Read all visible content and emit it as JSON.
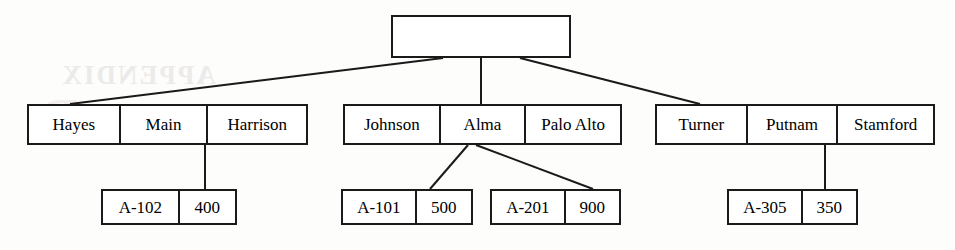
{
  "figure": {
    "watermark_text": "APPENDIX",
    "watermark_letter": "D",
    "line_color": "#1a1a1a",
    "background_color": "#fdfdfc",
    "text_color": "#000000"
  },
  "nodes": {
    "root": {
      "name": "root-index-node",
      "cells": [
        ""
      ]
    },
    "branches": [
      {
        "name": "branch-record-hayes",
        "cells": [
          "Hayes",
          "Main",
          "Harrison"
        ]
      },
      {
        "name": "branch-record-johnson",
        "cells": [
          "Johnson",
          "Alma",
          "Palo Alto"
        ]
      },
      {
        "name": "branch-record-turner",
        "cells": [
          "Turner",
          "Putnam",
          "Stamford"
        ]
      }
    ],
    "accounts": [
      {
        "name": "account-record-a102",
        "cells": [
          "A-102",
          "400"
        ]
      },
      {
        "name": "account-record-a101",
        "cells": [
          "A-101",
          "500"
        ]
      },
      {
        "name": "account-record-a201",
        "cells": [
          "A-201",
          "900"
        ]
      },
      {
        "name": "account-record-a305",
        "cells": [
          "A-305",
          "350"
        ]
      }
    ]
  },
  "edges": [
    {
      "name": "edge-root-to-hayes",
      "x1": 443,
      "y1": 58,
      "x2": 70,
      "y2": 104
    },
    {
      "name": "edge-root-to-johnson",
      "x1": 481,
      "y1": 58,
      "x2": 481,
      "y2": 104
    },
    {
      "name": "edge-root-to-turner",
      "x1": 520,
      "y1": 58,
      "x2": 700,
      "y2": 104
    },
    {
      "name": "edge-main-to-a102",
      "x1": 205,
      "y1": 145,
      "x2": 205,
      "y2": 189
    },
    {
      "name": "edge-alma-to-a101",
      "x1": 468,
      "y1": 145,
      "x2": 430,
      "y2": 189
    },
    {
      "name": "edge-alma-to-a201",
      "x1": 476,
      "y1": 145,
      "x2": 593,
      "y2": 189
    },
    {
      "name": "edge-putnam-to-a305",
      "x1": 825,
      "y1": 145,
      "x2": 825,
      "y2": 189
    }
  ]
}
